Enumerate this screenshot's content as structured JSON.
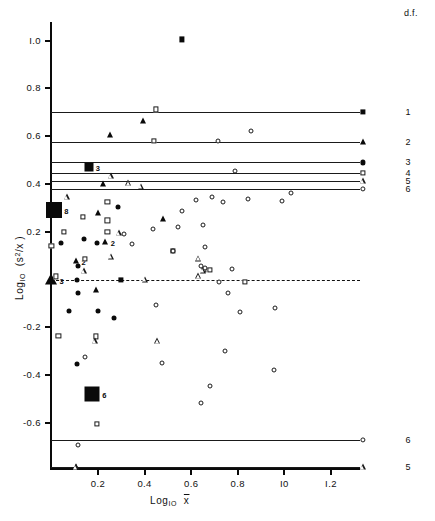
{
  "chart_data": {
    "type": "scatter",
    "title": "",
    "xlabel": "Log10 x̄",
    "ylabel": "Log10 (s²/x̄)",
    "xlabel_parts": {
      "prefix": "Log",
      "sub": "IO",
      "var": "x̄"
    },
    "ylabel_parts": {
      "prefix": "Log",
      "sub": "IO",
      "var": "(s²/x̄)"
    },
    "xlim": [
      -0.02,
      1.4
    ],
    "ylim": [
      -0.8,
      1.1
    ],
    "xticks": [
      0.2,
      0.4,
      0.6,
      0.8,
      1.0,
      1.2
    ],
    "xticklabels": [
      "0.2",
      "0.4",
      "0.6",
      "0.8",
      "I0",
      "I.2"
    ],
    "yticks": [
      1.0,
      0.8,
      0.6,
      0.4,
      0.2,
      -0.2,
      -0.4,
      -0.6
    ],
    "yticklabels": [
      "I.0",
      "0.8",
      "0.6",
      "0.4",
      "0.2",
      "-0.2",
      "-0.4",
      "-0.6"
    ],
    "grid": false,
    "legend_title": "d.f.",
    "legend_position": "right",
    "legend": [
      {
        "df": "1",
        "marker": "filled-square",
        "y": 0.7
      },
      {
        "df": "2",
        "marker": "filled-triangle",
        "y": 0.575
      },
      {
        "df": "3",
        "marker": "filled-circle",
        "y": 0.49
      },
      {
        "df": "4",
        "marker": "open-square",
        "y": 0.445
      },
      {
        "df": "5",
        "marker": "open-triangle",
        "y": 0.412
      },
      {
        "df": "6",
        "marker": "open-circle",
        "y": 0.38
      },
      {
        "df": "6",
        "marker": "open-circle",
        "y": -0.67
      },
      {
        "df": "5",
        "marker": "open-triangle",
        "y": -0.785
      }
    ],
    "reference_lines": [
      {
        "y": 0.7,
        "df": "1"
      },
      {
        "y": 0.575,
        "df": "2"
      },
      {
        "y": 0.49,
        "df": "3"
      },
      {
        "y": 0.445,
        "df": "4"
      },
      {
        "y": 0.412,
        "df": "5"
      },
      {
        "y": 0.38,
        "df": "6"
      },
      {
        "y": -0.67,
        "df": "6"
      },
      {
        "y": -0.785,
        "df": "5"
      }
    ],
    "dashed_line": {
      "y": 0.0
    },
    "series": [
      {
        "name": "filled-square",
        "marker": "filled-square",
        "points": [
          {
            "x": 0.56,
            "y": 1.005
          },
          {
            "x": 0.16,
            "y": 0.47,
            "label": "3",
            "big": true
          },
          {
            "x": 0.01,
            "y": 0.29,
            "label": "8",
            "big": true
          },
          {
            "x": 0.52,
            "y": 0.12
          },
          {
            "x": 0.3,
            "y": 0.0
          },
          {
            "x": 0.175,
            "y": -0.48,
            "label": "6",
            "big": true
          }
        ]
      },
      {
        "name": "filled-triangle",
        "marker": "filled-triangle",
        "points": [
          {
            "x": 0.395,
            "y": 0.665
          },
          {
            "x": 0.25,
            "y": 0.603
          },
          {
            "x": 0.22,
            "y": 0.398
          },
          {
            "x": 0.2,
            "y": 0.278
          },
          {
            "x": 0.48,
            "y": 0.252
          },
          {
            "x": 0.23,
            "y": 0.157,
            "label": "2"
          },
          {
            "x": 0.105,
            "y": 0.078,
            "label": "2"
          },
          {
            "x": 0.0,
            "y": 0.0,
            "label": "3",
            "big": true
          },
          {
            "x": 0.19,
            "y": -0.043
          },
          {
            "x": 0.105,
            "y": -0.785
          }
        ]
      },
      {
        "name": "filled-circle",
        "marker": "filled-circle",
        "points": [
          {
            "x": 0.04,
            "y": 0.152
          },
          {
            "x": 0.14,
            "y": 0.168
          },
          {
            "x": 0.195,
            "y": 0.152
          },
          {
            "x": 0.115,
            "y": 0.057
          },
          {
            "x": 0.11,
            "y": 0.0
          },
          {
            "x": 0.115,
            "y": -0.055
          },
          {
            "x": 0.075,
            "y": -0.13
          },
          {
            "x": 0.2,
            "y": -0.13
          },
          {
            "x": 0.27,
            "y": -0.16
          },
          {
            "x": 0.11,
            "y": -0.352
          },
          {
            "x": 0.285,
            "y": 0.305
          }
        ]
      },
      {
        "name": "open-square",
        "marker": "open-square",
        "points": [
          {
            "x": 0.45,
            "y": 0.712
          },
          {
            "x": 0.44,
            "y": 0.58
          },
          {
            "x": 0.24,
            "y": 0.325
          },
          {
            "x": 0.135,
            "y": 0.262
          },
          {
            "x": 0.24,
            "y": 0.248
          },
          {
            "x": 0.055,
            "y": 0.198
          },
          {
            "x": 0.24,
            "y": 0.2
          },
          {
            "x": 0.0,
            "y": 0.14
          },
          {
            "x": 0.145,
            "y": 0.085
          },
          {
            "x": 0.02,
            "y": 0.013
          },
          {
            "x": 0.655,
            "y": 0.042
          },
          {
            "x": 0.68,
            "y": 0.04
          },
          {
            "x": 0.03,
            "y": -0.235
          },
          {
            "x": 0.19,
            "y": -0.238
          },
          {
            "x": 0.83,
            "y": -0.01
          },
          {
            "x": 0.195,
            "y": -0.605
          }
        ]
      },
      {
        "name": "open-triangle",
        "marker": "open-triangle",
        "points": [
          {
            "x": 0.255,
            "y": 0.432
          },
          {
            "x": 0.33,
            "y": 0.403
          },
          {
            "x": 0.385,
            "y": 0.388
          },
          {
            "x": 0.065,
            "y": 0.345
          },
          {
            "x": 0.29,
            "y": 0.193
          },
          {
            "x": 0.255,
            "y": 0.095
          },
          {
            "x": 0.63,
            "y": 0.088
          },
          {
            "x": 0.14,
            "y": 0.035
          },
          {
            "x": 0.65,
            "y": 0.038
          },
          {
            "x": 0.63,
            "y": 0.015
          },
          {
            "x": 0.4,
            "y": 0.0
          },
          {
            "x": 0.185,
            "y": -0.258
          },
          {
            "x": 0.455,
            "y": -0.258
          },
          {
            "x": 0.105,
            "y": -0.785
          }
        ]
      },
      {
        "name": "open-circle",
        "marker": "open-circle",
        "points": [
          {
            "x": 0.855,
            "y": 0.622
          },
          {
            "x": 0.715,
            "y": 0.578
          },
          {
            "x": 0.79,
            "y": 0.455
          },
          {
            "x": 1.03,
            "y": 0.363
          },
          {
            "x": 0.69,
            "y": 0.345
          },
          {
            "x": 0.62,
            "y": 0.332
          },
          {
            "x": 0.735,
            "y": 0.325
          },
          {
            "x": 0.845,
            "y": 0.338
          },
          {
            "x": 0.99,
            "y": 0.33
          },
          {
            "x": 0.56,
            "y": 0.288
          },
          {
            "x": 0.545,
            "y": 0.218
          },
          {
            "x": 0.65,
            "y": 0.228
          },
          {
            "x": 0.435,
            "y": 0.21
          },
          {
            "x": 0.31,
            "y": 0.192
          },
          {
            "x": 0.345,
            "y": 0.148
          },
          {
            "x": 0.66,
            "y": 0.135
          },
          {
            "x": 0.52,
            "y": 0.12
          },
          {
            "x": 0.64,
            "y": 0.055
          },
          {
            "x": 0.66,
            "y": 0.048
          },
          {
            "x": 0.775,
            "y": 0.045
          },
          {
            "x": 0.72,
            "y": -0.012
          },
          {
            "x": 0.76,
            "y": -0.055
          },
          {
            "x": 0.45,
            "y": -0.108
          },
          {
            "x": 0.81,
            "y": -0.135
          },
          {
            "x": 0.96,
            "y": -0.118
          },
          {
            "x": 0.145,
            "y": -0.325
          },
          {
            "x": 0.475,
            "y": -0.348
          },
          {
            "x": 0.745,
            "y": -0.3
          },
          {
            "x": 0.955,
            "y": -0.378
          },
          {
            "x": 0.68,
            "y": -0.445
          },
          {
            "x": 0.64,
            "y": -0.518
          },
          {
            "x": 0.115,
            "y": -0.692
          }
        ]
      }
    ]
  },
  "axis": {
    "x_title_prefix": "Log",
    "x_title_sub": "IO",
    "x_title_var": "x",
    "y_title_prefix": "Log",
    "y_title_sub": "IO",
    "y_title_var": "(s",
    "y_title_sup": "2",
    "y_title_tail": "/x )"
  },
  "legend_header": "d.f."
}
